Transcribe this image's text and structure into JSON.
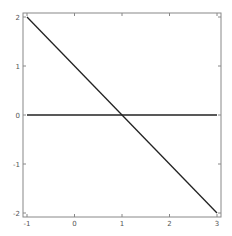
{
  "chart_data": {
    "type": "line",
    "title": "",
    "xlabel": "",
    "ylabel": "",
    "xlim": [
      -1,
      3
    ],
    "ylim": [
      -2,
      2
    ],
    "grid": false,
    "x_ticks": [
      "-1",
      "0",
      "1",
      "2",
      "3"
    ],
    "y_ticks": [
      "2",
      "1",
      "0",
      "-1",
      "-2"
    ],
    "series": [
      {
        "name": "y = 1 - x",
        "x": [
          -1,
          3
        ],
        "y": [
          2,
          -2
        ]
      },
      {
        "name": "y = 0",
        "x": [
          -1,
          3
        ],
        "y": [
          0,
          0
        ]
      }
    ]
  },
  "style": {
    "line_color": "#222222",
    "frame_color": "#888888",
    "label_color": "#555555"
  }
}
